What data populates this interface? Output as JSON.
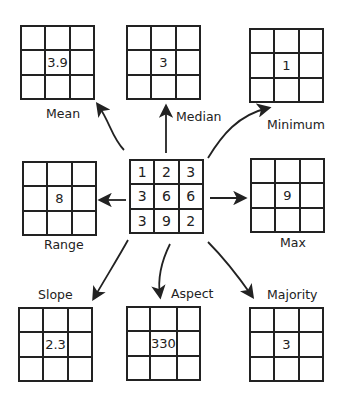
{
  "input_grid": {
    "cells": [
      "1",
      "2",
      "3",
      "3",
      "6",
      "6",
      "3",
      "9",
      "2"
    ]
  },
  "outputs": [
    {
      "id": "mean",
      "label": "Mean",
      "value": "3.9"
    },
    {
      "id": "median",
      "label": "Median",
      "value": "3"
    },
    {
      "id": "minimum",
      "label": "Minimum",
      "value": "1"
    },
    {
      "id": "range",
      "label": "Range",
      "value": "8"
    },
    {
      "id": "max",
      "label": "Max",
      "value": "9"
    },
    {
      "id": "slope",
      "label": "Slope",
      "value": "2.3"
    },
    {
      "id": "aspect",
      "label": "Aspect",
      "value": "330"
    },
    {
      "id": "majority",
      "label": "Majority",
      "value": "3"
    }
  ],
  "colors": {
    "line": "#222222",
    "background": "#ffffff"
  }
}
